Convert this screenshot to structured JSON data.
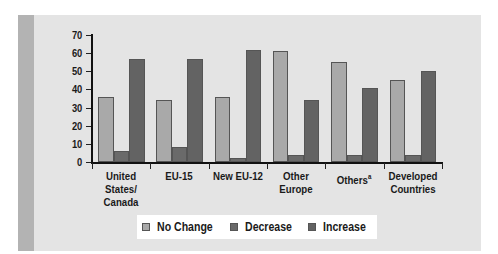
{
  "chart_data": {
    "type": "bar",
    "title": "",
    "xlabel": "",
    "ylabel": "",
    "ylim": [
      0,
      70
    ],
    "yticks": [
      0,
      10,
      20,
      30,
      40,
      50,
      60,
      70
    ],
    "grid": false,
    "legend_position": "bottom",
    "categories": [
      "United States/ Canada",
      "EU-15",
      "New EU-12",
      "Other Europe",
      "Othersᵃ",
      "Developed Countries"
    ],
    "category_labels": [
      {
        "line1": "United States/",
        "line2": "Canada",
        "sup": ""
      },
      {
        "line1": "EU-15",
        "line2": "",
        "sup": ""
      },
      {
        "line1": "New EU-12",
        "line2": "",
        "sup": ""
      },
      {
        "line1": "Other",
        "line2": "Europe",
        "sup": ""
      },
      {
        "line1": "Others",
        "line2": "",
        "sup": "a"
      },
      {
        "line1": "Developed",
        "line2": "Countries",
        "sup": ""
      }
    ],
    "series": [
      {
        "name": "No Change",
        "color": "#a9a9a9",
        "values": [
          36,
          34,
          36,
          61,
          55,
          45
        ]
      },
      {
        "name": "Decrease",
        "color": "#6a6a6a",
        "values": [
          6,
          8,
          2,
          4,
          4,
          4
        ]
      },
      {
        "name": "Increase",
        "color": "#636363",
        "values": [
          57,
          57,
          62,
          34,
          41,
          50
        ]
      }
    ]
  },
  "legend": {
    "items": [
      {
        "label": "No Change",
        "color": "#a9a9a9"
      },
      {
        "label": "Decrease",
        "color": "#6a6a6a"
      },
      {
        "label": "Increase",
        "color": "#636363"
      }
    ]
  }
}
